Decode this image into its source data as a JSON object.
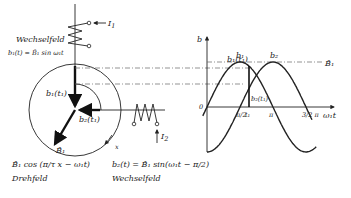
{
  "left_diagram": {
    "coil1": {
      "current_label": "I",
      "current_sub": "1",
      "field_type": "Wechselfeld",
      "equation": "b₁(t) = B̂₁ sin ω₁t"
    },
    "coil2": {
      "current_label": "I",
      "current_sub": "2"
    },
    "vectors": {
      "b1_label": "b₁(t₁)",
      "b2_label": "b₂(t₁)",
      "B1_label": "B̂₁"
    },
    "angle_label": "x",
    "bottom_left": {
      "equation": "B̂₁ cos (π/τ x − ω₁t)",
      "caption": "Drehfeld"
    },
    "bottom_right": {
      "equation": "b₂(t) = B̂₁ sin(ω₁t − π/2)",
      "caption": "Wechselfeld"
    }
  },
  "chart_data": {
    "type": "line",
    "title": "",
    "xlabel": "ω₁t",
    "ylabel": "b",
    "origin_label": "0",
    "x_ticks": [
      {
        "value": 1.5708,
        "label": "π/2"
      },
      {
        "value": 2.0,
        "label": "t₁"
      },
      {
        "value": 3.1416,
        "label": "π"
      },
      {
        "value": 4.7124,
        "label": "3/2 π"
      }
    ],
    "xlim": [
      0,
      5.6
    ],
    "ylim": [
      -1.0,
      1.0
    ],
    "amplitude_label": "B̂₁",
    "series": [
      {
        "name": "b₁",
        "function": "sin(x)",
        "x_range": [
          -0.2,
          5.2
        ]
      },
      {
        "name": "b₂",
        "function": "sin(x - π/2)",
        "x_range": [
          0,
          5.0
        ]
      }
    ],
    "annotations": [
      {
        "text": "b₁(t₁)",
        "at_x": 2.0
      },
      {
        "text": "b₂(t₁)",
        "at_x": 2.0
      }
    ],
    "t1": 2.0
  }
}
